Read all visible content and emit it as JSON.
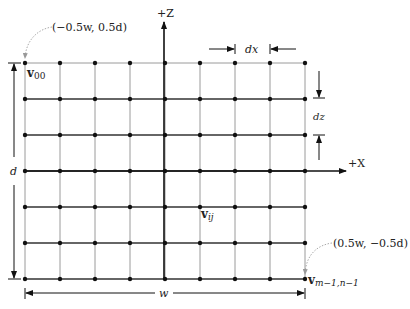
{
  "diagram": {
    "type": "vertex-grid",
    "grid": {
      "columns": 9,
      "rows": 7,
      "origin_px": [
        25,
        63
      ],
      "dx_px": 35,
      "dz_px": 36,
      "horizontal_line_color": "#333333",
      "top_line_color": "#9a9a9a",
      "vertical_line_color": "#9a9a9a",
      "point_color": "#111111"
    },
    "axes": {
      "z_label": "+Z",
      "x_label": "+X"
    },
    "labels": {
      "v00": "v",
      "v00_sub": "00",
      "vij": "v",
      "vij_sub": "ij",
      "vlast": "v",
      "vlast_sub": "m−1,n−1",
      "corner_top_left": "(−0.5w, 0.5d)",
      "corner_bottom_right": "(0.5w, −0.5d)"
    },
    "dimensions": {
      "dx": "dx",
      "dz": "dz",
      "width": "w",
      "depth": "d"
    }
  }
}
